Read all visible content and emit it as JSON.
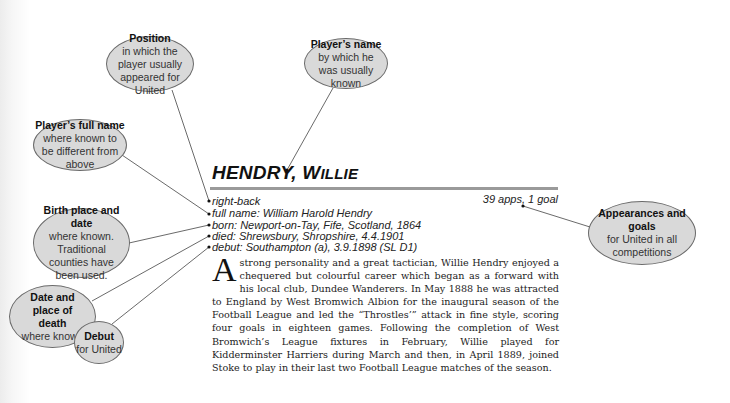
{
  "callouts": {
    "position": {
      "title": "Position",
      "text": "in which the player usually appeared for United"
    },
    "players_name": {
      "title": "Player’s name",
      "text": "by which he was usually known"
    },
    "full_name": {
      "title": "Player’s full name",
      "text": "where known to be different from above"
    },
    "birth": {
      "title": "Birth place and date",
      "text": "where known. Traditional counties have been used."
    },
    "death": {
      "title": "Date and place of death",
      "text": "where known"
    },
    "debut": {
      "title": "Debut",
      "text": "for United"
    },
    "appearances": {
      "title": "Appearances and goals",
      "text": "for United in all competitions"
    }
  },
  "entry": {
    "surname": "HENDRY,",
    "forename_initial": "W",
    "forename_rest": "ILLIE",
    "position": "right-back",
    "full_name": "full name: William Harold Hendry",
    "born": "born: Newport-on-Tay, Fife, Scotland, 1864",
    "died": "died: Shrewsbury, Shropshire, 4.4.1901",
    "debut": "debut: Southampton (a), 3.9.1898 (SL D1)",
    "apps_goals": "39 apps, 1 goal",
    "dropcap": "A",
    "biography": "strong personality and a great tactician, Willie Hendry enjoyed a chequered but colourful career which began as a forward with his local club, Dundee Wanderers. In May 1888 he was attracted to England by West Bromwich Albion for the inaugural season of the Football League and led the “Throstles’” attack in fine style, scoring four goals in eighteen games. Following the completion of West Bromwich’s League fixtures in February, Willie played for Kidderminster Harriers during March and then, in April 1889, joined Stoke to play in their last two Football League matches of the season."
  }
}
